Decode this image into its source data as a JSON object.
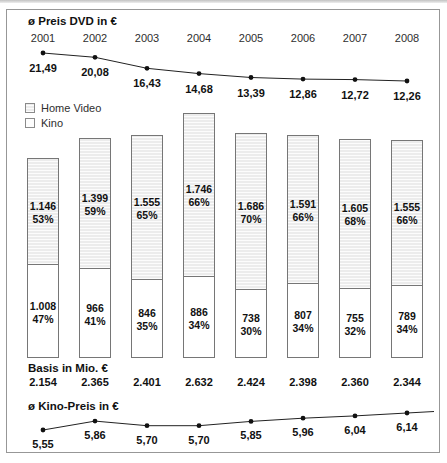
{
  "dvd_chart": {
    "title": "ø Preis DVD in €",
    "years": [
      "2001",
      "2002",
      "2003",
      "2004",
      "2005",
      "2006",
      "2007",
      "2008"
    ],
    "values_display": [
      "21,49",
      "20,08",
      "16,43",
      "14,68",
      "13,39",
      "12,86",
      "12,72",
      "12,26"
    ]
  },
  "legend": {
    "home_video": "Home Video",
    "kino": "Kino"
  },
  "bars": [
    {
      "home_video_value": "1.146",
      "home_video_pct": "53%",
      "kino_value": "1.008",
      "kino_pct": "47%",
      "basis": "2.154"
    },
    {
      "home_video_value": "1.399",
      "home_video_pct": "59%",
      "kino_value": "966",
      "kino_pct": "41%",
      "basis": "2.365"
    },
    {
      "home_video_value": "1.555",
      "home_video_pct": "65%",
      "kino_value": "846",
      "kino_pct": "35%",
      "basis": "2.401"
    },
    {
      "home_video_value": "1.746",
      "home_video_pct": "66%",
      "kino_value": "886",
      "kino_pct": "34%",
      "basis": "2.632"
    },
    {
      "home_video_value": "1.686",
      "home_video_pct": "70%",
      "kino_value": "738",
      "kino_pct": "30%",
      "basis": "2.424"
    },
    {
      "home_video_value": "1.591",
      "home_video_pct": "66%",
      "kino_value": "807",
      "kino_pct": "34%",
      "basis": "2.398"
    },
    {
      "home_video_value": "1.605",
      "home_video_pct": "68%",
      "kino_value": "755",
      "kino_pct": "32%",
      "basis": "2.360"
    },
    {
      "home_video_value": "1.555",
      "home_video_pct": "66%",
      "kino_value": "789",
      "kino_pct": "34%",
      "basis": "2.344"
    }
  ],
  "basis_label": "Basis in Mio. €",
  "kino_chart": {
    "title": "ø Kino-Preis in €",
    "values_display": [
      "5,55",
      "5,86",
      "5,70",
      "5,70",
      "5,85",
      "5,96",
      "6,04",
      "6,14"
    ]
  },
  "colors": {
    "line": "#222222",
    "point": "#111111",
    "bar_border": "#767676",
    "home_video_fill": "#ececec",
    "kino_fill": "#ffffff"
  },
  "chart_data": [
    {
      "type": "line",
      "title": "ø Preis DVD in €",
      "x": [
        2001,
        2002,
        2003,
        2004,
        2005,
        2006,
        2007,
        2008
      ],
      "values": [
        21.49,
        20.08,
        16.43,
        14.68,
        13.39,
        12.86,
        12.72,
        12.26
      ],
      "ylabel": "€",
      "grid": false,
      "data_labels": true
    },
    {
      "type": "bar",
      "subtype": "stacked",
      "title": "Basis in Mio. €",
      "categories": [
        2001,
        2002,
        2003,
        2004,
        2005,
        2006,
        2007,
        2008
      ],
      "series": [
        {
          "name": "Home Video",
          "values": [
            1146,
            1399,
            1555,
            1746,
            1686,
            1591,
            1605,
            1555
          ],
          "pct": [
            53,
            59,
            65,
            66,
            70,
            66,
            68,
            66
          ]
        },
        {
          "name": "Kino",
          "values": [
            1008,
            966,
            846,
            886,
            738,
            807,
            755,
            789
          ],
          "pct": [
            47,
            41,
            35,
            34,
            30,
            34,
            32,
            34
          ]
        }
      ],
      "totals": [
        2154,
        2365,
        2401,
        2632,
        2424,
        2398,
        2360,
        2344
      ],
      "legend_position": "top-left",
      "grid": false
    },
    {
      "type": "line",
      "title": "ø Kino-Preis in €",
      "x": [
        2001,
        2002,
        2003,
        2004,
        2005,
        2006,
        2007,
        2008
      ],
      "values": [
        5.55,
        5.86,
        5.7,
        5.7,
        5.85,
        5.96,
        6.04,
        6.14
      ],
      "ylabel": "€",
      "grid": false,
      "data_labels": true
    }
  ]
}
